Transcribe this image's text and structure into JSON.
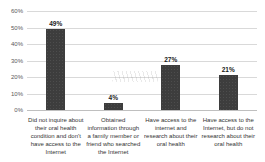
{
  "chart_data": {
    "type": "bar",
    "title": "",
    "xlabel": "",
    "ylabel": "",
    "categories": [
      "Did not inquire about\ntheir oral health\ncondition and don't\nhave access to the\nInternet",
      "Obtained\ninformation through\na family member or\nfriend who searched\nthe Internet",
      "Have access to the\ninternet and\nresearch about their\noral health",
      "Have access to the\nInternet, but do not\nresearch about their\noral health"
    ],
    "values": [
      49,
      4,
      27,
      21
    ],
    "value_labels": [
      "49%",
      "4%",
      "27%",
      "21%"
    ],
    "ylim": [
      0,
      60
    ],
    "ytick_step": 10,
    "yticks": [
      "0%",
      "10%",
      "20%",
      "30%",
      "40%",
      "50%",
      "60%"
    ],
    "grid": true,
    "legend": false
  },
  "colors": {
    "bar": "#3d3d3d",
    "gridline": "#d9d9d9",
    "baseline": "#bfbfbf",
    "tick_text": "#595959",
    "category_text": "#333333",
    "value_text": "#1a1a1a",
    "background": "#ffffff"
  }
}
